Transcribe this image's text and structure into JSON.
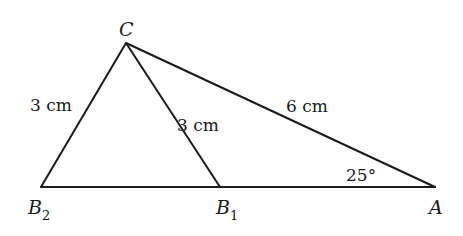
{
  "diagram": {
    "type": "geometry-triangle",
    "vertices": {
      "C": {
        "label": "C",
        "x": 126,
        "y": 43
      },
      "B2": {
        "label": "B",
        "sub": "2",
        "x": 41,
        "y": 187
      },
      "B1": {
        "label": "B",
        "sub": "1",
        "x": 220,
        "y": 187
      },
      "A": {
        "label": "A",
        "x": 435,
        "y": 187
      }
    },
    "segments": [
      {
        "from": "C",
        "to": "B2",
        "length_label": "3 cm"
      },
      {
        "from": "C",
        "to": "B1",
        "length_label": "3 cm"
      },
      {
        "from": "C",
        "to": "A",
        "length_label": "6 cm"
      },
      {
        "from": "B2",
        "to": "A",
        "length_label": ""
      }
    ],
    "angle": {
      "at": "A",
      "label": "25°"
    }
  },
  "labels": {
    "C": "C",
    "B2_main": "B",
    "B2_sub": "2",
    "B1_main": "B",
    "B1_sub": "1",
    "A": "A",
    "CB2": "3 cm",
    "CB1": "3 cm",
    "CA": "6 cm",
    "angle_A": "25°"
  }
}
